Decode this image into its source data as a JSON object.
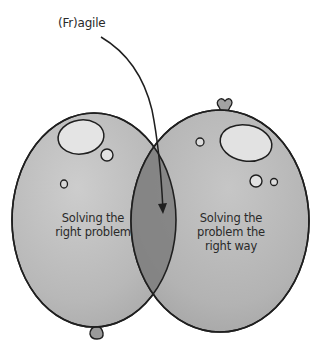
{
  "diagram": {
    "type": "venn",
    "style": "hand-drawn balloons",
    "annotation": {
      "text": "(Fr)agile",
      "points_to": "intersection"
    },
    "sets": [
      {
        "id": "left",
        "label_lines": [
          "Solving the",
          "right problem"
        ]
      },
      {
        "id": "right",
        "label_lines": [
          "Solving the",
          "problem the",
          "right way"
        ]
      }
    ],
    "colors": {
      "balloon_fill": "#b9b9b9",
      "balloon_highlight": "#e4e4e4",
      "intersection_fill": "#7d7d7d",
      "outline": "#1f1f1f",
      "background": "#ffffff"
    }
  }
}
